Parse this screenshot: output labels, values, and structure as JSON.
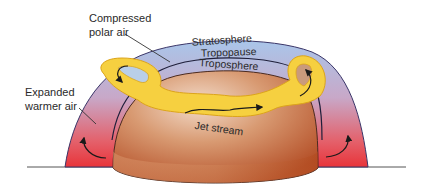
{
  "diagram": {
    "labels": {
      "compressed_line1": "Compressed",
      "compressed_line2": "polar air",
      "stratosphere": "Stratosphere",
      "tropopause": "Tropopause",
      "troposphere": "Troposphere",
      "expanded_line1": "Expanded",
      "expanded_line2": "warmer air",
      "jet_stream": "Jet stream"
    },
    "colors": {
      "polar_air": "#a8c4e6",
      "warm_air": "#e83a3a",
      "earth_light": "#e8c3a4",
      "earth_dark": "#b9542a",
      "jet_stream": "#f7d23e",
      "jet_stream_edge": "#e0a81c",
      "outline": "#3a3060"
    }
  }
}
